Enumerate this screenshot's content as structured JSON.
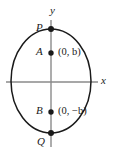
{
  "figure": {
    "background_color": "#ffffff",
    "curve_color": "#1a1a1a",
    "axis_color": "#8a8a8a",
    "point_color": "#1a1a1a",
    "text_color": "#1a1a1a"
  },
  "axes": {
    "x_label": "x",
    "y_label": "y",
    "x_axis_y": 82,
    "y_axis_x": 51
  },
  "ellipse": {
    "center_x": 51,
    "center_y": 81,
    "radius_x": 40,
    "radius_y": 52
  },
  "points": [
    {
      "name": "P",
      "label": "P",
      "coord_label": "",
      "x": 51,
      "y": 29,
      "label_side": "left"
    },
    {
      "name": "A",
      "label": "A",
      "coord_label": "(0, b)",
      "x": 51,
      "y": 53,
      "label_side": "left"
    },
    {
      "name": "B",
      "label": "B",
      "coord_label": "(0, −b)",
      "x": 51,
      "y": 112,
      "label_side": "left"
    },
    {
      "name": "Q",
      "label": "Q",
      "coord_label": "",
      "x": 51,
      "y": 133,
      "label_side": "left"
    }
  ],
  "labels": {
    "point_p": "P",
    "point_a": "A",
    "point_b": "B",
    "point_q": "Q",
    "coord_a": "(0, b)",
    "coord_b": "(0, −b)",
    "axis_x": "x",
    "axis_y": "y"
  }
}
